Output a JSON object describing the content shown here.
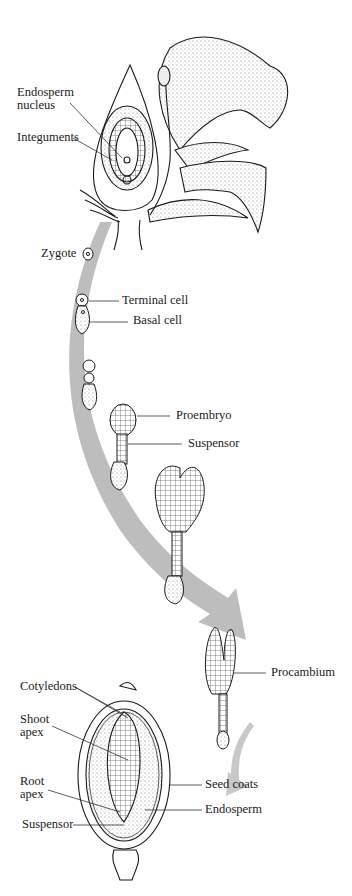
{
  "figure": {
    "type": "embryo-development-diagram",
    "arrow_color": "#bdbdbd",
    "line_color": "#1a1a1a"
  },
  "labels": {
    "endosperm_nucleus_1": "Endosperm",
    "endosperm_nucleus_2": "nucleus",
    "integuments": "Integuments",
    "zygote": "Zygote",
    "terminal_cell": "Terminal cell",
    "basal_cell": "Basal cell",
    "proembryo": "Proembryo",
    "suspensor_top": "Suspensor",
    "procambium": "Procambium",
    "cotyledons": "Cotyledons",
    "shoot_apex_1": "Shoot",
    "shoot_apex_2": "apex",
    "root_apex_1": "Root",
    "root_apex_2": "apex",
    "seed_coats": "Seed coats",
    "endosperm": "Endosperm",
    "suspensor_bottom": "Suspensor"
  },
  "stages": [
    {
      "name": "flower-ovule"
    },
    {
      "name": "zygote"
    },
    {
      "name": "two-cell"
    },
    {
      "name": "four-cell"
    },
    {
      "name": "proembryo"
    },
    {
      "name": "heart-stage"
    },
    {
      "name": "torpedo-stage"
    },
    {
      "name": "mature-seed"
    }
  ]
}
